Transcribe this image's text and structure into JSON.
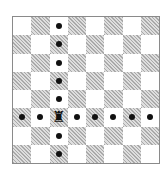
{
  "diagram": {
    "type": "chessboard",
    "size": 8,
    "top_left_square": "light",
    "colors": {
      "light": "#ffffff",
      "dark": "#d6d6d6",
      "border": "#8a8a8a",
      "marker": "#111111"
    },
    "piece": {
      "name": "rook",
      "color": "black",
      "glyph": "♜",
      "file": "c",
      "rank": 3
    },
    "move_markers": [
      {
        "file": "c",
        "rank": 8
      },
      {
        "file": "c",
        "rank": 7
      },
      {
        "file": "c",
        "rank": 6
      },
      {
        "file": "c",
        "rank": 5
      },
      {
        "file": "c",
        "rank": 4
      },
      {
        "file": "c",
        "rank": 2
      },
      {
        "file": "c",
        "rank": 1
      },
      {
        "file": "a",
        "rank": 3
      },
      {
        "file": "b",
        "rank": 3
      },
      {
        "file": "d",
        "rank": 3
      },
      {
        "file": "e",
        "rank": 3
      },
      {
        "file": "f",
        "rank": 3
      },
      {
        "file": "g",
        "rank": 3
      },
      {
        "file": "h",
        "rank": 3
      }
    ]
  }
}
